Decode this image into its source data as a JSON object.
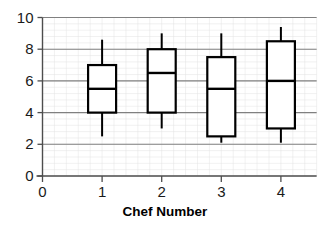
{
  "chart_data": {
    "type": "box",
    "title": "",
    "xlabel": "Chef Number",
    "ylabel": "",
    "categories": [
      "1",
      "2",
      "3",
      "4"
    ],
    "xtick_labels": [
      "0",
      "1",
      "2",
      "3",
      "4"
    ],
    "ytick_labels": [
      "0",
      "2",
      "4",
      "6",
      "8",
      "10"
    ],
    "xlim": [
      0,
      4.6
    ],
    "ylim": [
      0,
      10
    ],
    "grid": {
      "major_horizontal": true,
      "minor": true,
      "major_color": "#808080",
      "minor_color": "#e2e2e2",
      "minor_divisions": 5
    },
    "box_style": {
      "fill": "#ffffff",
      "edge_color": "#000000",
      "edge_width": 2.2,
      "median_width": 2.4,
      "whisker_width": 2.0,
      "box_width_units": 0.47
    },
    "boxes": [
      {
        "label": "1",
        "x": 1,
        "min": 2.5,
        "q1": 4.0,
        "median": 5.5,
        "q3": 7.0,
        "max": 8.6,
        "whisker_caps": false
      },
      {
        "label": "2",
        "x": 2,
        "min": 3.0,
        "q1": 4.0,
        "median": 6.5,
        "q3": 8.0,
        "max": 9.0,
        "whisker_caps": false
      },
      {
        "label": "3",
        "x": 3,
        "min": 2.1,
        "q1": 2.5,
        "median": 5.5,
        "q3": 7.5,
        "max": 9.0,
        "whisker_caps": false
      },
      {
        "label": "4",
        "x": 4,
        "min": 2.1,
        "q1": 3.0,
        "median": 6.0,
        "q3": 8.5,
        "max": 9.4,
        "whisker_caps": false
      }
    ]
  },
  "axes": {
    "x_axis_name": "x-axis",
    "y_axis_name": "y-axis"
  }
}
